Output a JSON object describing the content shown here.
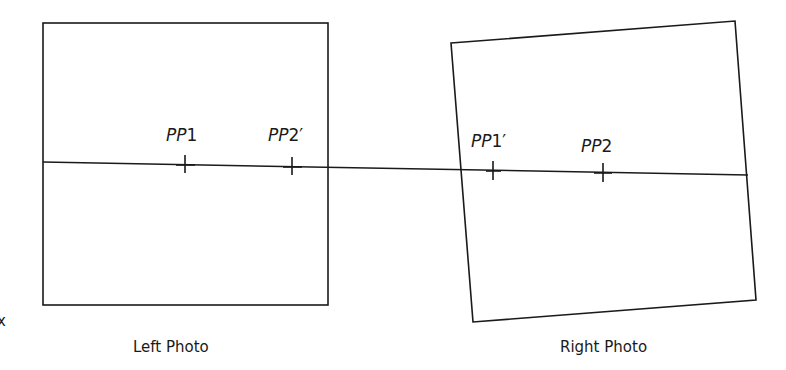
{
  "diagram": {
    "left_photo": {
      "caption": "Left Photo"
    },
    "right_photo": {
      "caption": "Right Photo"
    },
    "points": [
      {
        "id": "pp1",
        "prefix": "PP",
        "suffix": "1"
      },
      {
        "id": "pp2-prime",
        "prefix": "PP",
        "suffix": "2′"
      },
      {
        "id": "pp1-prime",
        "prefix": "PP",
        "suffix": "1′"
      },
      {
        "id": "pp2",
        "prefix": "PP",
        "suffix": "2"
      }
    ],
    "axis_label": "x",
    "line_color": "#1a1a1a"
  }
}
